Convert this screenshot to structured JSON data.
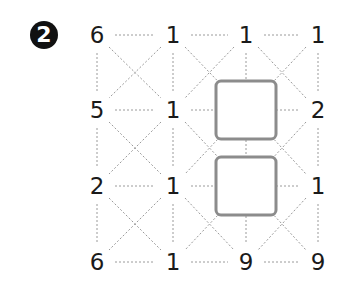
{
  "puzzle": {
    "badge_label": "2",
    "grid_rows": 4,
    "grid_cols": 4,
    "values": [
      [
        "6",
        "1",
        "1",
        "1"
      ],
      [
        "5",
        "1",
        "",
        "2"
      ],
      [
        "2",
        "1",
        "",
        "1"
      ],
      [
        "6",
        "1",
        "9",
        "9"
      ]
    ],
    "empty_boxes": [
      {
        "row": 1,
        "col": 2,
        "label": ""
      },
      {
        "row": 2,
        "col": 2,
        "label": ""
      }
    ],
    "colors": {
      "text": "#1a1a1a",
      "badge_bg": "#111111",
      "badge_text": "#ffffff",
      "dotted_line": "#9a9a9a",
      "box_border": "#8c8c8c"
    }
  }
}
